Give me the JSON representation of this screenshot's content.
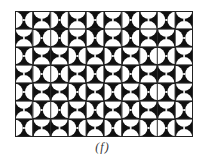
{
  "figure": {
    "caption": "(f)",
    "columns": 10,
    "rows": 7,
    "colors": {
      "ink": "#111111",
      "paper": "#ffffff",
      "border": "#222222"
    },
    "legend": {
      "V": "white semicircles on left and right edges",
      "H": "white semicircles on top and bottom edges"
    },
    "tiles": [
      [
        "V",
        "H",
        "V",
        "H",
        "V",
        "H",
        "V",
        "H",
        "V",
        "H"
      ],
      [
        "H",
        "V",
        "V",
        "H",
        "V",
        "H",
        "V",
        "H",
        "H",
        "V"
      ],
      [
        "V",
        "H",
        "H",
        "V",
        "H",
        "V",
        "H",
        "V",
        "V",
        "H"
      ],
      [
        "H",
        "V",
        "V",
        "H",
        "V",
        "H",
        "V",
        "H",
        "H",
        "V"
      ],
      [
        "V",
        "H",
        "H",
        "V",
        "H",
        "V",
        "H",
        "V",
        "V",
        "H"
      ],
      [
        "H",
        "V",
        "V",
        "H",
        "V",
        "H",
        "V",
        "H",
        "H",
        "V"
      ],
      [
        "V",
        "H",
        "H",
        "V",
        "H",
        "V",
        "H",
        "V",
        "V",
        "H"
      ]
    ]
  }
}
